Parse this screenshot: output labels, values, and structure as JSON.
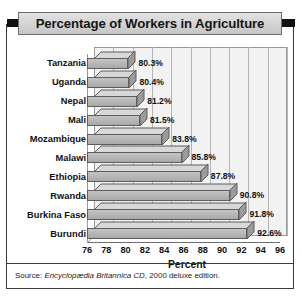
{
  "title": "Percentage of Workers in Agriculture",
  "source": {
    "prefix": "Source: ",
    "italic": "Encyclopædia Britannica CD",
    "suffix": ", 2000 deluxe edition."
  },
  "chart_data": {
    "type": "bar",
    "orientation": "horizontal",
    "title": "Percentage of Workers in Agriculture",
    "xlabel": "Percent",
    "ylabel": "",
    "xlim": [
      76,
      96
    ],
    "xticks": [
      76,
      78,
      80,
      82,
      84,
      86,
      88,
      90,
      92,
      94,
      96
    ],
    "grid": true,
    "legend": false,
    "categories": [
      "Tanzania",
      "Uganda",
      "Nepal",
      "Mali",
      "Mozambique",
      "Malawi",
      "Ethiopia",
      "Rwanda",
      "Burkina Faso",
      "Burundi"
    ],
    "values": [
      80.3,
      80.4,
      81.2,
      81.5,
      83.8,
      85.8,
      87.8,
      90.8,
      91.8,
      92.6
    ],
    "data_labels": [
      "80.3%",
      "80.4%",
      "81.2%",
      "81.5%",
      "83.8%",
      "85.8%",
      "87.8%",
      "90.8%",
      "91.8%",
      "92.6%"
    ]
  },
  "colors": {
    "bar_face": "#b7b7b7",
    "bar_outline": "#5d5d5d",
    "plot_background": "#f2f2f2",
    "gridline": "#b4b4b4",
    "frame": "#3a3a3a",
    "title_bar": "#d2d2d2",
    "title_tab": "#111111",
    "text": "#111111"
  }
}
